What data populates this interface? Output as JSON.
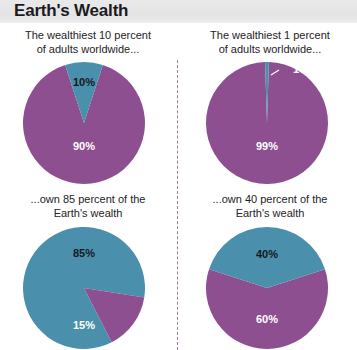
{
  "header": {
    "title": "Earth's Wealth"
  },
  "colors": {
    "purple": "#8e4f91",
    "teal": "#4a8fab",
    "header_band": "#e6e6e8",
    "divider": "#9a7e9c",
    "label_light": "#ffffff",
    "label_dark": "#16181c"
  },
  "panels": {
    "top_left": {
      "caption": "The wealthiest 10 percent\nof adults worldwide..."
    },
    "top_right": {
      "caption": "The wealthiest 1 percent\nof adults worldwide..."
    },
    "bottom_left": {
      "caption": "...own 85 percent of the\nEarth's wealth"
    },
    "bottom_right": {
      "caption": "...own 40 percent of the\nEarth's wealth"
    }
  },
  "chart_data": [
    {
      "id": "top-left",
      "type": "pie",
      "title": "The wealthiest 10 percent of adults worldwide...",
      "categories": [
        "Wealthiest 10 percent",
        "Remaining 90 percent"
      ],
      "values": [
        10,
        90
      ],
      "labels": [
        "10%",
        "90%"
      ],
      "colors": [
        "#4a8fab",
        "#8e4f91"
      ],
      "legend": "none",
      "units": "percent"
    },
    {
      "id": "top-right",
      "type": "pie",
      "title": "The wealthiest 1 percent of adults worldwide...",
      "categories": [
        "Wealthiest 1 percent",
        "Remaining 99 percent"
      ],
      "values": [
        1,
        99
      ],
      "labels": [
        "1%",
        "99%"
      ],
      "colors": [
        "#4a8fab",
        "#8e4f91"
      ],
      "legend": "none",
      "units": "percent"
    },
    {
      "id": "bottom-left",
      "type": "pie",
      "title": "...own 85 percent of the Earth's wealth",
      "categories": [
        "Wealth owned",
        "Remaining wealth"
      ],
      "values": [
        85,
        15
      ],
      "labels": [
        "85%",
        "15%"
      ],
      "colors": [
        "#4a8fab",
        "#8e4f91"
      ],
      "legend": "none",
      "units": "percent"
    },
    {
      "id": "bottom-right",
      "type": "pie",
      "title": "...own 40 percent of the Earth's wealth",
      "categories": [
        "Wealth owned",
        "Remaining wealth"
      ],
      "values": [
        40,
        60
      ],
      "labels": [
        "40%",
        "60%"
      ],
      "colors": [
        "#4a8fab",
        "#8e4f91"
      ],
      "legend": "none",
      "units": "percent"
    }
  ]
}
